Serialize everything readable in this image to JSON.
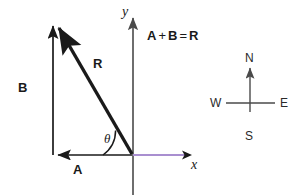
{
  "figure": {
    "equation": {
      "term_a": "A",
      "plus": "+",
      "term_b": "B",
      "equals": "=",
      "term_r": "R"
    },
    "axes": {
      "x_label": "x",
      "y_label": "y",
      "x_axis_color": "#a98fd0",
      "y_axis_color": "#4a4a4a"
    },
    "vectors": [
      {
        "name": "A",
        "label": "A",
        "direction": "left",
        "color": "#1a1a1a"
      },
      {
        "name": "B",
        "label": "B",
        "direction": "up",
        "color": "#1a1a1a"
      },
      {
        "name": "R",
        "label": "R",
        "direction": "up-left-diagonal",
        "color": "#1a1a1a"
      }
    ],
    "angle": {
      "label": "θ"
    },
    "compass": {
      "north": "N",
      "south": "S",
      "east": "E",
      "west": "W",
      "color": "#4a4a4a"
    }
  }
}
